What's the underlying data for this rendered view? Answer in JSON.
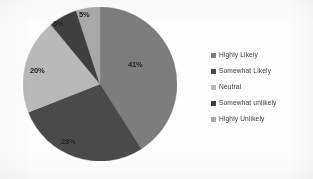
{
  "chart_data": {
    "type": "pie",
    "title": "",
    "subtitle": "",
    "xlabel": "",
    "ylabel": "",
    "grid": false,
    "legend_position": "right",
    "start_angle_deg": 0,
    "direction": "clockwise",
    "categories": [
      "Highly Likely",
      "Somewhat Likely",
      "Neutral",
      "Somewhat unlikely",
      "Highly Unlikely"
    ],
    "values": [
      41,
      28,
      20,
      6,
      5
    ],
    "value_unit": "%",
    "data_labels": [
      "41%",
      "28%",
      "20%",
      "6%",
      "5%"
    ],
    "colors": [
      "#7d7d7d",
      "#4a4a4a",
      "#b9b9b9",
      "#3f3f3f",
      "#a9a9a9"
    ],
    "slices": [
      {
        "label": "Highly Likely",
        "value": 41,
        "data_label": "41%",
        "color": "#7d7d7d",
        "label_x": 128,
        "label_y": 60
      },
      {
        "label": "Somewhat Likely",
        "value": 28,
        "data_label": "28%",
        "color": "#4a4a4a",
        "label_x": 61,
        "label_y": 137
      },
      {
        "label": "Neutral",
        "value": 20,
        "data_label": "20%",
        "color": "#b9b9b9",
        "label_x": 30,
        "label_y": 66
      },
      {
        "label": "Somewhat unlikely",
        "value": 6,
        "data_label": "6%",
        "color": "#3f3f3f",
        "label_x": 53,
        "label_y": 19
      },
      {
        "label": "Highly Unlikely",
        "value": 5,
        "data_label": "5%",
        "color": "#a9a9a9",
        "label_x": 79,
        "label_y": 10
      }
    ]
  },
  "legend": {
    "items": [
      {
        "label": "Highly Likely",
        "color": "#7d7d7d",
        "swatch_icon": "legend-square-icon"
      },
      {
        "label": "Somewhat Likely",
        "color": "#4a4a4a",
        "swatch_icon": "legend-square-icon"
      },
      {
        "label": "Neutral",
        "color": "#b9b9b9",
        "swatch_icon": "legend-square-icon"
      },
      {
        "label": "Somewhat unlikely",
        "color": "#3f3f3f",
        "swatch_icon": "legend-square-icon"
      },
      {
        "label": "Highly Unlikely",
        "color": "#a9a9a9",
        "swatch_icon": "legend-square-icon"
      }
    ]
  }
}
